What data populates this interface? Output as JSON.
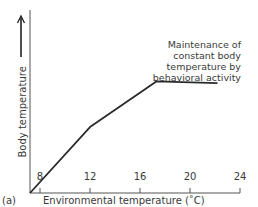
{
  "chart_data": {
    "type": "line",
    "title": "",
    "panel_label": "(a)",
    "xlabel": "Environmental temperature (˚C)",
    "ylabel": "Body temperature",
    "ylabel_arrow": "up-arrow",
    "xlim": [
      7.2,
      24
    ],
    "x_ticks": [
      8,
      12,
      16,
      20,
      24
    ],
    "y_ticks": [],
    "ylim": [
      0,
      100
    ],
    "y_units": "relative (no numeric scale shown)",
    "grid": false,
    "legend": null,
    "series": [
      {
        "name": "Body temperature",
        "color": "#2a2a2a",
        "points": [
          {
            "x": 7.2,
            "y": 0
          },
          {
            "x": 12.0,
            "y": 36
          },
          {
            "x": 17.3,
            "y": 61
          },
          {
            "x": 22.2,
            "y": 60
          }
        ]
      }
    ],
    "annotations": [
      {
        "text_lines": [
          "Maintenance of",
          "constant body",
          "temperature by",
          "behavioral activity"
        ],
        "points_to": "plateau segment (17.3–22.2 ˚C)"
      }
    ]
  }
}
